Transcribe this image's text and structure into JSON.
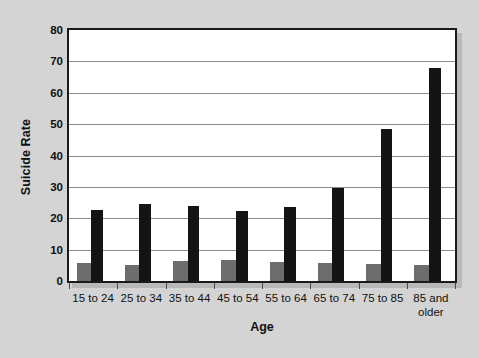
{
  "chart_data": {
    "type": "bar",
    "title": "",
    "xlabel": "Age",
    "ylabel": "Suicide Rate",
    "ylim": [
      0,
      80
    ],
    "ytick_step": 10,
    "yticks": [
      80,
      70,
      60,
      50,
      40,
      30,
      20,
      10,
      0
    ],
    "grid": true,
    "legend": "none",
    "categories": [
      "15 to 24",
      "25 to 34",
      "35 to 44",
      "45 to 54",
      "55 to 64",
      "65 to 74",
      "75 to 85",
      "85 and older"
    ],
    "series": [
      {
        "name": "grey-series",
        "color": "#6d6d6d",
        "values": [
          5.9,
          5.0,
          6.4,
          6.7,
          6.2,
          5.8,
          5.4,
          5.0
        ]
      },
      {
        "name": "black-series",
        "color": "#141414",
        "values": [
          22.6,
          24.6,
          23.9,
          22.4,
          23.6,
          29.5,
          48.6,
          68.0
        ]
      }
    ]
  },
  "colors": {
    "page_background": "#d4d4d4",
    "plot_background": "#ffffff",
    "plot_border": "#1a1a1a",
    "gridline": "#8a8a8a",
    "shadow": "#b9b9b9",
    "text": "#111111"
  }
}
